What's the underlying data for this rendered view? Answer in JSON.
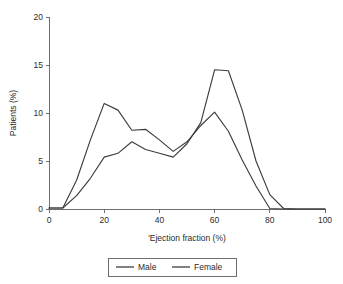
{
  "chart_data": {
    "type": "line",
    "title": "",
    "xlabel": "'Ejection fraction (%)",
    "ylabel": "Patients (%)",
    "xlim": [
      0,
      100
    ],
    "ylim": [
      0,
      20
    ],
    "xticks": [
      "0",
      "20",
      "40",
      "60",
      "80",
      "100"
    ],
    "yticks": [
      "0",
      "5",
      "10",
      "15",
      "20"
    ],
    "xtick_values": [
      0,
      20,
      40,
      60,
      80,
      100
    ],
    "ytick_values": [
      0,
      5,
      10,
      15,
      20
    ],
    "grid": false,
    "legend_position": "below-plot",
    "line_color": "#3d3d3d",
    "axis_color": "#6e6e6e",
    "x": [
      0,
      5,
      10,
      15,
      20,
      25,
      30,
      35,
      40,
      45,
      50,
      55,
      60,
      65,
      70,
      75,
      80,
      85,
      90,
      100
    ],
    "series": [
      {
        "name": "Male",
        "values": [
          0.1,
          0.1,
          3.0,
          7.2,
          11.0,
          10.3,
          8.2,
          8.3,
          7.2,
          6.0,
          7.0,
          8.7,
          10.1,
          8.1,
          5.1,
          2.4,
          0.05,
          0,
          0,
          0
        ]
      },
      {
        "name": "Female",
        "values": [
          0.1,
          0.1,
          1.4,
          3.2,
          5.4,
          5.8,
          7.0,
          6.2,
          5.8,
          5.4,
          6.8,
          9.0,
          14.5,
          14.4,
          10.3,
          5.0,
          1.5,
          0.05,
          0,
          0
        ]
      }
    ]
  },
  "legend": {
    "entries": [
      {
        "label": "Male"
      },
      {
        "label": "Female"
      }
    ]
  }
}
